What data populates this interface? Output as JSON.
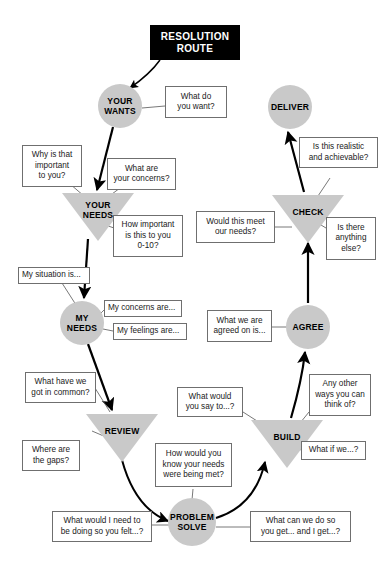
{
  "diagram": {
    "title": "RESOLUTION\nROUTE",
    "colors": {
      "node_fill": "#c9c9c9",
      "title_bg": "#000000",
      "title_text": "#ffffff",
      "callout_border": "#6f6f6f",
      "line": "#000000"
    },
    "nodes": [
      {
        "id": "your-wants",
        "label": "YOUR\nWANTS",
        "shape": "circle"
      },
      {
        "id": "your-needs",
        "label": "YOUR\nNEEDS",
        "shape": "triangle"
      },
      {
        "id": "my-needs",
        "label": "MY\nNEEDS",
        "shape": "circle"
      },
      {
        "id": "review",
        "label": "REVIEW",
        "shape": "triangle"
      },
      {
        "id": "problem-solve",
        "label": "PROBLEM\nSOLVE",
        "shape": "circle"
      },
      {
        "id": "build",
        "label": "BUILD",
        "shape": "triangle"
      },
      {
        "id": "agree",
        "label": "AGREE",
        "shape": "circle"
      },
      {
        "id": "check",
        "label": "CHECK",
        "shape": "triangle"
      },
      {
        "id": "deliver",
        "label": "DELIVER",
        "shape": "circle"
      }
    ],
    "callouts": [
      {
        "id": "what-do-you-want",
        "text": "What do\nyou want?"
      },
      {
        "id": "why-important",
        "text": "Why is that\nimportant\nto you?"
      },
      {
        "id": "what-are-concerns",
        "text": "What are\nyour concerns?"
      },
      {
        "id": "how-important-0-10",
        "text": "How important\nis this to you\n0-10?"
      },
      {
        "id": "my-situation",
        "text": "My situation is..."
      },
      {
        "id": "my-concerns",
        "text": "My concerns are..."
      },
      {
        "id": "my-feelings",
        "text": "My feelings are..."
      },
      {
        "id": "what-in-common",
        "text": "What have we\ngot in common?"
      },
      {
        "id": "where-are-gaps",
        "text": "Where are\nthe gaps?"
      },
      {
        "id": "how-know-needs-met",
        "text": "How would you\nknow your needs\nwere being met?"
      },
      {
        "id": "what-would-i-need",
        "text": "What would I need to\nbe doing so you felt...?"
      },
      {
        "id": "what-can-we-do",
        "text": "What can we do so\nyou get... and I get...?"
      },
      {
        "id": "what-would-you-say",
        "text": "What would\nyou say to...?"
      },
      {
        "id": "any-other-ways",
        "text": "Any other\nways you can\nthink of?"
      },
      {
        "id": "what-if-we",
        "text": "What if we...?"
      },
      {
        "id": "what-agreed-on",
        "text": "What we are\nagreed on is..."
      },
      {
        "id": "would-this-meet",
        "text": "Would this meet\nour needs?"
      },
      {
        "id": "anything-else",
        "text": "Is there\nanything\nelse?"
      },
      {
        "id": "realistic-achievable",
        "text": "Is this realistic\nand achievable?"
      }
    ]
  }
}
